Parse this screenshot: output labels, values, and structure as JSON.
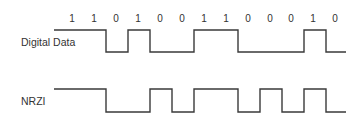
{
  "diagram": {
    "bits": [
      "1",
      "1",
      "0",
      "1",
      "0",
      "0",
      "1",
      "1",
      "0",
      "0",
      "0",
      "1",
      "0"
    ],
    "bit_label_x": [
      72,
      94,
      116,
      138,
      160,
      182,
      204,
      226,
      248,
      270,
      291,
      313,
      335
    ],
    "bit_label_y": 22,
    "rows": [
      {
        "label": "Digital Data",
        "label_x": 21,
        "label_y": 46,
        "high_y": 30,
        "low_y": 52,
        "start_x": 54,
        "end_x": 346,
        "start_level": "high",
        "transitions_x": [
          106,
          128,
          150,
          194,
          238,
          304,
          326
        ]
      },
      {
        "label": "NRZI",
        "label_x": 21,
        "label_y": 105,
        "high_y": 89,
        "low_y": 112,
        "start_x": 54,
        "end_x": 346,
        "start_level": "high",
        "transitions_x": [
          106,
          150,
          172,
          194,
          238,
          260,
          282,
          304,
          326
        ]
      }
    ],
    "colors": {
      "line": "#3a3a3a",
      "text": "#333333",
      "background": "#ffffff"
    }
  }
}
